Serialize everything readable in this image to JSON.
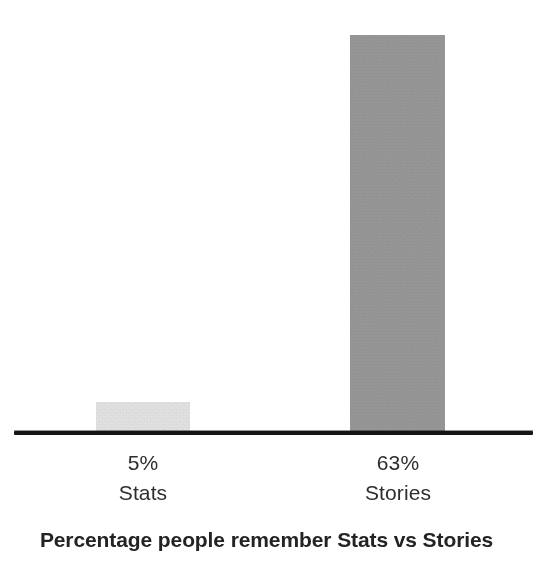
{
  "chart_data": {
    "type": "bar",
    "title": "Percentage people remember Stats vs Stories",
    "subtitle": "",
    "xlabel": "",
    "ylabel": "",
    "ylim": [
      0,
      68
    ],
    "grid": false,
    "legend": "none",
    "categories": [
      "Stats",
      "Stories"
    ],
    "values": [
      5,
      63
    ],
    "value_labels": [
      "5%",
      "63%"
    ],
    "colors": [
      "#e2e2e2",
      "#979797"
    ],
    "axis_color": "#151515",
    "background": "#ffffff",
    "points": [
      {
        "category": "Stats",
        "value": 5,
        "value_label": "5%",
        "color": "#e2e2e2"
      },
      {
        "category": "Stories",
        "value": 63,
        "value_label": "63%",
        "color": "#979797"
      }
    ]
  },
  "figure": {
    "title": "Percentage people remember Stats vs Stories",
    "bars": [
      {
        "value_label": "5%",
        "name": "Stats"
      },
      {
        "value_label": "63%",
        "name": "Stories"
      }
    ]
  }
}
